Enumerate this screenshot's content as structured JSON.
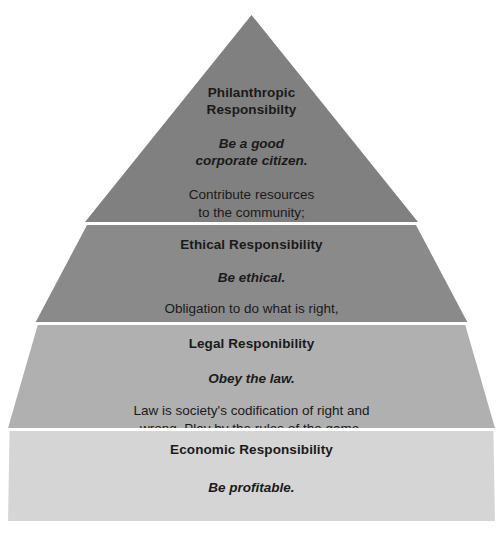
{
  "diagram": {
    "type": "pyramid",
    "tiers": [
      {
        "title": "Philanthropic\nResponsibilty",
        "title_line1": "Philanthropic",
        "title_line2": "Responsibilty",
        "tagline_line1": "Be a good",
        "tagline_line2": "corporate citizen.",
        "body_line1": "Contribute resources",
        "body_line2": "to the community;",
        "body_line3": "improve quality of life.",
        "color": "#808080"
      },
      {
        "title_line1": "Ethical Responsibility",
        "tagline_line1": "Be ethical.",
        "body_line1": "Obligation to do what is right,",
        "body_line2": "just, and fair. Avoid harm.",
        "color": "#8a8a8a"
      },
      {
        "title_line1": "Legal Responibility",
        "tagline_line1": "Obey the law.",
        "body_line1": "Law is society's codification of right and",
        "body_line2": "wrong. Play by the rules of the game.",
        "color": "#b0b0b0"
      },
      {
        "title_line1": "Economic Responsibility",
        "tagline_line1": "Be profitable.",
        "body_line1": "The foundation upon which all others rest.",
        "color": "#d5d5d5"
      }
    ],
    "background_color": "#ffffff",
    "text_color": "#1a1a1a"
  }
}
